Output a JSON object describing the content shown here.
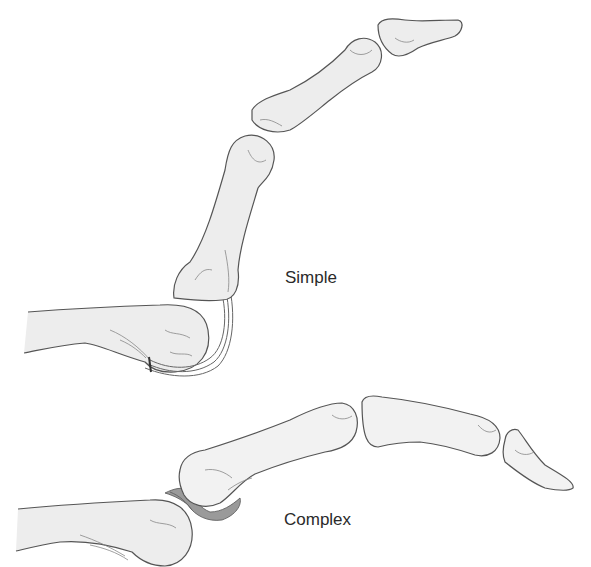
{
  "figure": {
    "caption_clipped": "Dorsal dislocation of the metacarpophalangeal joint (simple vs complex)",
    "labels": {
      "simple": "Simple",
      "complex": "Complex"
    },
    "panels": [
      {
        "id": "simple",
        "label": "Simple",
        "description": "MCP dislocation with proximal phalanx perched dorsally; volar plate remains anterior"
      },
      {
        "id": "complex",
        "label": "Complex",
        "description": "MCP dislocation with volar plate interposed between metacarpal head and proximal phalanx base"
      }
    ]
  }
}
